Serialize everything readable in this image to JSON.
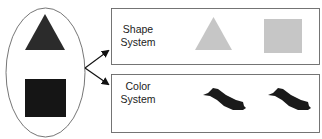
{
  "diagram": {
    "source_group": {
      "shapes": [
        {
          "type": "triangle",
          "color": "#2b2b2b"
        },
        {
          "type": "square",
          "color": "#151515"
        }
      ]
    },
    "systems": [
      {
        "label_line1": "Shape",
        "label_line2": "System",
        "shapes": [
          {
            "type": "triangle",
            "color": "#c4c4c4"
          },
          {
            "type": "square",
            "color": "#c4c4c4"
          }
        ]
      },
      {
        "label_line1": "Color",
        "label_line2": "System",
        "shapes": [
          {
            "type": "blob",
            "color": "#1a1a1a"
          },
          {
            "type": "blob",
            "color": "#1a1a1a"
          }
        ]
      }
    ],
    "colors": {
      "outline": "#555555",
      "arrow": "#111111"
    }
  }
}
